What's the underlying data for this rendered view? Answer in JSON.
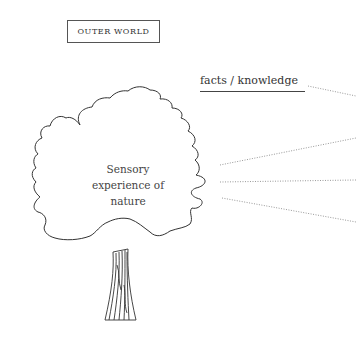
{
  "outer_label": "OUTER WORLD",
  "tree": {
    "crown_text": "Sensory experience of nature",
    "crown_lines": [
      "Sensory",
      "experience of",
      "nature"
    ]
  },
  "facts_label": "facts / knowledge",
  "connectors": [
    {
      "from": [
        308,
        86
      ],
      "to": [
        356,
        96
      ],
      "style": "dotted"
    },
    {
      "from": [
        220,
        165
      ],
      "to": [
        356,
        138
      ],
      "style": "dotted"
    },
    {
      "from": [
        220,
        182
      ],
      "to": [
        356,
        180
      ],
      "style": "dotted"
    },
    {
      "from": [
        222,
        198
      ],
      "to": [
        356,
        222
      ],
      "style": "dotted"
    }
  ],
  "colors": {
    "line": "#333333",
    "dotted": "#999999",
    "text": "#444444"
  }
}
